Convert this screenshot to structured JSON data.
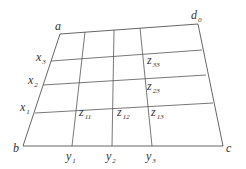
{
  "diagram": {
    "title": "",
    "colors": {
      "line": "#555555",
      "text": "#333333",
      "background": "#ffffff"
    },
    "corners": [
      {
        "id": "a",
        "label": "a",
        "sub": "",
        "x": 60,
        "y": 34,
        "lx": 55,
        "ly": 30
      },
      {
        "id": "d0",
        "label": "d",
        "sub": "0",
        "x": 198,
        "y": 24,
        "lx": 191,
        "ly": 19
      },
      {
        "id": "b",
        "label": "b",
        "sub": "",
        "x": 23,
        "y": 146,
        "lx": 13,
        "ly": 152
      },
      {
        "id": "c",
        "label": "c",
        "sub": "",
        "x": 223,
        "y": 146,
        "lx": 226,
        "ly": 152
      }
    ],
    "x_lines": [
      {
        "label": "x",
        "sub": "3",
        "x1": 51,
        "y1": 61,
        "x2": 202,
        "y2": 50,
        "lx": 36,
        "ly": 61
      },
      {
        "label": "x",
        "sub": "2",
        "x1": 43,
        "y1": 85,
        "x2": 206,
        "y2": 75,
        "lx": 28,
        "ly": 84
      },
      {
        "label": "x",
        "sub": "1",
        "x1": 35,
        "y1": 113,
        "x2": 213,
        "y2": 103,
        "lx": 20,
        "ly": 111
      }
    ],
    "y_lines": [
      {
        "label": "y",
        "sub": "1",
        "x1": 85,
        "y1": 32,
        "x2": 72,
        "y2": 146,
        "lx": 66,
        "ly": 160
      },
      {
        "label": "y",
        "sub": "2",
        "x1": 114,
        "y1": 30,
        "x2": 112,
        "y2": 146,
        "lx": 106,
        "ly": 160
      },
      {
        "label": "y",
        "sub": "3",
        "x1": 140,
        "y1": 28,
        "x2": 152,
        "y2": 146,
        "lx": 146,
        "ly": 160
      }
    ],
    "z_labels": [
      {
        "label": "z",
        "sub": "33",
        "lx": 147,
        "ly": 64
      },
      {
        "label": "z",
        "sub": "23",
        "lx": 147,
        "ly": 90
      },
      {
        "label": "z",
        "sub": "13",
        "lx": 151,
        "ly": 116
      },
      {
        "label": "z",
        "sub": "11",
        "lx": 79,
        "ly": 116
      },
      {
        "label": "z",
        "sub": "12",
        "lx": 117,
        "ly": 116
      }
    ]
  }
}
